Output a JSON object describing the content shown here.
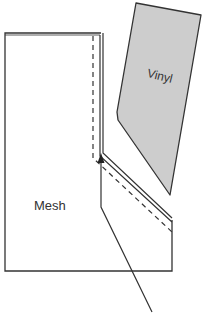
{
  "diagram": {
    "type": "sewing-pattern-seam",
    "colors": {
      "background": "#ffffff",
      "stroke": "#333333",
      "vinyl_fill": "#cdcdcd",
      "label": "#333333"
    },
    "pieces": [
      {
        "id": "mesh",
        "label": "Mesh",
        "fill": "#ffffff"
      },
      {
        "id": "vinyl",
        "label": "Vinyl",
        "fill": "#cdcdcd"
      }
    ],
    "annotations": {
      "arrow": "pointer-arrow-to-seam-corner",
      "dashed_line": "stitch-line",
      "double_line": "seam-edge"
    }
  }
}
